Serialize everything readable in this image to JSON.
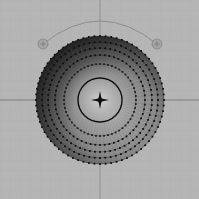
{
  "viewport": {
    "background": "#b5b5b5",
    "grid_color": "#a9a9a9",
    "axis_color": "#6e6e6e",
    "center": [
      100,
      100
    ],
    "grid_spacing": 10
  },
  "mesh": {
    "name": "disc-mesh",
    "outer_radius": 64,
    "vertex_color": "#111111",
    "rings": [
      {
        "r": 64,
        "vertices": 72
      },
      {
        "r": 58,
        "vertices": 68
      },
      {
        "r": 52,
        "vertices": 64
      },
      {
        "r": 45,
        "vertices": 60
      },
      {
        "r": 36,
        "vertices": 56
      }
    ],
    "inner_circle": {
      "r": 22,
      "stroke": "#111111"
    },
    "shade_light": "#9a9a9a",
    "shade_dark": "#1c1c1c"
  },
  "gizmo": {
    "arc_color": "#8e8e8e",
    "handles": [
      {
        "name": "left-handle",
        "x": 43,
        "y": 44,
        "r": 5
      },
      {
        "name": "right-handle",
        "x": 157,
        "y": 44,
        "r": 5
      }
    ]
  }
}
